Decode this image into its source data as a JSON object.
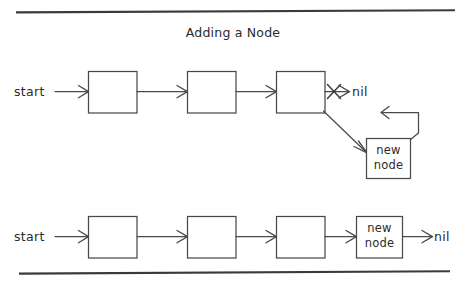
{
  "figure": {
    "title": "Adding a Node",
    "background_color": "#ffffff",
    "ink_color": "#4a4a4a",
    "rule_color": "#3a3a3a"
  },
  "diagrams": [
    {
      "id": "before",
      "caption_role": "list before the new node is linked in",
      "start_label": "start",
      "nil_label": "nil",
      "nodes": [
        {
          "label": "",
          "role": "list-node"
        },
        {
          "label": "",
          "role": "list-node"
        },
        {
          "label": "",
          "role": "list-node"
        }
      ],
      "new_node": {
        "line1": "new",
        "line2": "node"
      },
      "annotations": {
        "crossed_pointer": "x",
        "crossed_pointer_meaning": "old nil pointer is crossed out"
      }
    },
    {
      "id": "after",
      "caption_role": "list after the new node is linked in",
      "start_label": "start",
      "nil_label": "nil",
      "nodes": [
        {
          "label": "",
          "role": "list-node"
        },
        {
          "label": "",
          "role": "list-node"
        },
        {
          "label": "",
          "role": "list-node"
        }
      ],
      "new_node": {
        "line1": "new",
        "line2": "node"
      }
    }
  ],
  "text": {
    "title": "Adding a Node",
    "start": "start",
    "nil": "nil",
    "new": "new",
    "node": "node"
  }
}
